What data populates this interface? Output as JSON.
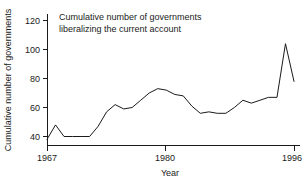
{
  "chart_data": {
    "type": "line",
    "title": "",
    "annotation": {
      "line1": "Cumulative number of governments",
      "line2": "liberalizing the current account"
    },
    "xlabel": "Year",
    "ylabel": "Cumulative number of governments",
    "xlim": [
      1967,
      1996
    ],
    "ylim": [
      34,
      124
    ],
    "xticks": [
      1967,
      1980,
      1996
    ],
    "xtick_labels": [
      "1967",
      "1980",
      "1996"
    ],
    "yticks": [
      40,
      60,
      80,
      100,
      120
    ],
    "ytick_labels": [
      "40",
      "60",
      "80",
      "100",
      "120"
    ],
    "grid": false,
    "legend": "none",
    "line_color": "#1a1a1a",
    "series": [
      {
        "name": "Cumulative number of governments liberalizing the current account",
        "x": [
          1967,
          1968,
          1969,
          1970,
          1971,
          1972,
          1973,
          1974,
          1975,
          1976,
          1977,
          1978,
          1979,
          1980,
          1981,
          1982,
          1983,
          1984,
          1985,
          1986,
          1987,
          1988,
          1989,
          1990,
          1991,
          1992,
          1993,
          1994,
          1995,
          1996
        ],
        "values": [
          38,
          48,
          40,
          40,
          40,
          40,
          47,
          57,
          62,
          59,
          60,
          65,
          70,
          73,
          72,
          69,
          68,
          61,
          56,
          57,
          56,
          56,
          60,
          65,
          63,
          65,
          67,
          67,
          104,
          78
        ]
      }
    ]
  }
}
